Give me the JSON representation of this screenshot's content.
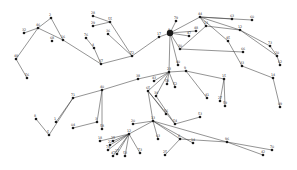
{
  "diagram": {
    "type": "network-graph",
    "width": 297,
    "height": 170,
    "colors": {
      "background": "#ffffff",
      "edge": "#3a3a3a",
      "node": "#1a1a1a",
      "label": "#333333"
    },
    "nodes": [
      {
        "id": "n8hub",
        "label": "8",
        "x": 170,
        "y": 33,
        "r": 3.2
      },
      {
        "id": "n17",
        "label": "17",
        "x": 159,
        "y": 37,
        "r": 1.3
      },
      {
        "id": "n72",
        "label": "72",
        "x": 132,
        "y": 56,
        "r": 1.3
      },
      {
        "id": "n37",
        "label": "37",
        "x": 101,
        "y": 64,
        "r": 1.3
      },
      {
        "id": "n4",
        "label": "4",
        "x": 94,
        "y": 48,
        "r": 1.3
      },
      {
        "id": "n76",
        "label": "76",
        "x": 86,
        "y": 38,
        "r": 1.3
      },
      {
        "id": "n55",
        "label": "55",
        "x": 110,
        "y": 22,
        "r": 1.3
      },
      {
        "id": "n28",
        "label": "28",
        "x": 93,
        "y": 16,
        "r": 1.3
      },
      {
        "id": "n29",
        "label": "29",
        "x": 93,
        "y": 26,
        "r": 1.3
      },
      {
        "id": "n36a",
        "label": "36",
        "x": 108,
        "y": 34,
        "r": 1.3
      },
      {
        "id": "n2",
        "label": "2",
        "x": 51,
        "y": 18,
        "r": 1.3
      },
      {
        "id": "n32",
        "label": "32",
        "x": 24,
        "y": 33,
        "r": 1.3
      },
      {
        "id": "n46",
        "label": "46",
        "x": 38,
        "y": 28,
        "r": 1.3
      },
      {
        "id": "n16",
        "label": "16",
        "x": 63,
        "y": 40,
        "r": 1.3
      },
      {
        "id": "n68",
        "label": "68",
        "x": 52,
        "y": 41,
        "r": 1.3
      },
      {
        "id": "n48a",
        "label": "48",
        "x": 16,
        "y": 59,
        "r": 1.3
      },
      {
        "id": "n56a",
        "label": "56",
        "x": 27,
        "y": 78,
        "r": 1.3
      },
      {
        "id": "n79",
        "label": "79",
        "x": 176,
        "y": 21,
        "r": 1.3
      },
      {
        "id": "n44",
        "label": "44",
        "x": 200,
        "y": 17,
        "r": 1.3
      },
      {
        "id": "n63a",
        "label": "63",
        "x": 232,
        "y": 19,
        "r": 1.3
      },
      {
        "id": "n60",
        "label": "60",
        "x": 252,
        "y": 20,
        "r": 1.3
      },
      {
        "id": "n13a",
        "label": "13",
        "x": 206,
        "y": 26,
        "r": 1.3
      },
      {
        "id": "n48b",
        "label": "48",
        "x": 196,
        "y": 31,
        "r": 1.3
      },
      {
        "id": "n47a",
        "label": "47",
        "x": 189,
        "y": 36,
        "r": 1.3
      },
      {
        "id": "n30",
        "label": "30",
        "x": 180,
        "y": 49,
        "r": 1.3
      },
      {
        "id": "n40a",
        "label": "40",
        "x": 178,
        "y": 65,
        "r": 1.3
      },
      {
        "id": "n45",
        "label": "45",
        "x": 228,
        "y": 41,
        "r": 1.3
      },
      {
        "id": "n12a",
        "label": "12",
        "x": 240,
        "y": 30,
        "r": 1.3
      },
      {
        "id": "n73a",
        "label": "73",
        "x": 270,
        "y": 46,
        "r": 1.3
      },
      {
        "id": "n20a",
        "label": "20",
        "x": 277,
        "y": 56,
        "r": 1.3
      },
      {
        "id": "n62",
        "label": "62",
        "x": 280,
        "y": 65,
        "r": 1.3
      },
      {
        "id": "n66",
        "label": "66",
        "x": 243,
        "y": 52,
        "r": 1.3
      },
      {
        "id": "n33",
        "label": "33",
        "x": 242,
        "y": 66,
        "r": 1.3
      },
      {
        "id": "n14a",
        "label": "14",
        "x": 273,
        "y": 78,
        "r": 1.3
      },
      {
        "id": "n09",
        "label": "09",
        "x": 280,
        "y": 107,
        "r": 1.3
      },
      {
        "id": "n23",
        "label": "23",
        "x": 169,
        "y": 72,
        "r": 1.3
      },
      {
        "id": "n9",
        "label": "9",
        "x": 186,
        "y": 71,
        "r": 1.3
      },
      {
        "id": "n38",
        "label": "38",
        "x": 138,
        "y": 79,
        "r": 1.3
      },
      {
        "id": "n43",
        "label": "43",
        "x": 154,
        "y": 81,
        "r": 1.3
      },
      {
        "id": "n58a",
        "label": "58",
        "x": 167,
        "y": 84,
        "r": 1.3
      },
      {
        "id": "n52",
        "label": "52",
        "x": 175,
        "y": 87,
        "r": 1.3
      },
      {
        "id": "n65",
        "label": "65",
        "x": 148,
        "y": 91,
        "r": 1.3
      },
      {
        "id": "n34",
        "label": "34",
        "x": 156,
        "y": 96,
        "r": 1.3
      },
      {
        "id": "n56b",
        "label": "56",
        "x": 166,
        "y": 114,
        "r": 1.3
      },
      {
        "id": "n54",
        "label": "54",
        "x": 175,
        "y": 124,
        "r": 1.3
      },
      {
        "id": "n53a",
        "label": "53",
        "x": 200,
        "y": 117,
        "r": 1.3
      },
      {
        "id": "n41",
        "label": "41",
        "x": 207,
        "y": 98,
        "r": 1.3
      },
      {
        "id": "n15",
        "label": "15",
        "x": 224,
        "y": 79,
        "r": 1.3
      },
      {
        "id": "n27a",
        "label": "27",
        "x": 220,
        "y": 101,
        "r": 1.3
      },
      {
        "id": "n59",
        "label": "59",
        "x": 225,
        "y": 106,
        "r": 1.3
      },
      {
        "id": "n40b",
        "label": "40",
        "x": 102,
        "y": 90,
        "r": 1.3
      },
      {
        "id": "n71",
        "label": "71",
        "x": 73,
        "y": 98,
        "r": 1.3
      },
      {
        "id": "n1",
        "label": "1",
        "x": 56,
        "y": 122,
        "r": 1.3
      },
      {
        "id": "n5",
        "label": "5",
        "x": 49,
        "y": 135,
        "r": 1.3
      },
      {
        "id": "n8b",
        "label": "8",
        "x": 36,
        "y": 119,
        "r": 1.3
      },
      {
        "id": "n3",
        "label": "3",
        "x": 97,
        "y": 122,
        "r": 1.3
      },
      {
        "id": "n58b",
        "label": "58",
        "x": 102,
        "y": 129,
        "r": 1.3
      },
      {
        "id": "n04",
        "label": "04",
        "x": 73,
        "y": 128,
        "r": 1.3
      },
      {
        "id": "n13b",
        "label": "13",
        "x": 153,
        "y": 121,
        "r": 1.3
      },
      {
        "id": "n20b",
        "label": "20",
        "x": 133,
        "y": 124,
        "r": 1.3
      },
      {
        "id": "n12b",
        "label": "12",
        "x": 129,
        "y": 134,
        "r": 1.3
      },
      {
        "id": "n18",
        "label": "18",
        "x": 100,
        "y": 141,
        "r": 1.3
      },
      {
        "id": "n25a",
        "label": "25",
        "x": 113,
        "y": 141,
        "r": 1.3
      },
      {
        "id": "n22",
        "label": "22",
        "x": 110,
        "y": 145,
        "r": 1.3
      },
      {
        "id": "n74",
        "label": "74",
        "x": 108,
        "y": 150,
        "r": 1.3
      },
      {
        "id": "n27b",
        "label": "27",
        "x": 117,
        "y": 154,
        "r": 1.3
      },
      {
        "id": "n47b",
        "label": "47",
        "x": 113,
        "y": 156,
        "r": 1.3
      },
      {
        "id": "n53b",
        "label": "53",
        "x": 125,
        "y": 156,
        "r": 1.3
      },
      {
        "id": "n73b",
        "label": "73",
        "x": 140,
        "y": 153,
        "r": 1.3
      },
      {
        "id": "n63b",
        "label": "63",
        "x": 158,
        "y": 139,
        "r": 1.3
      },
      {
        "id": "n6",
        "label": "6",
        "x": 180,
        "y": 139,
        "r": 1.3
      },
      {
        "id": "n14b",
        "label": "14",
        "x": 193,
        "y": 143,
        "r": 1.3
      },
      {
        "id": "n25b",
        "label": "25",
        "x": 165,
        "y": 155,
        "r": 1.3
      },
      {
        "id": "n96",
        "label": "96",
        "x": 227,
        "y": 142,
        "r": 1.3
      },
      {
        "id": "n70",
        "label": "70",
        "x": 272,
        "y": 150,
        "r": 1.3
      },
      {
        "id": "n42",
        "label": "42",
        "x": 263,
        "y": 155,
        "r": 1.3
      }
    ],
    "edges": [
      [
        "n8hub",
        "n17"
      ],
      [
        "n17",
        "n72"
      ],
      [
        "n72",
        "n37"
      ],
      [
        "n72",
        "n55"
      ],
      [
        "n72",
        "n36a"
      ],
      [
        "n37",
        "n4"
      ],
      [
        "n4",
        "n76"
      ],
      [
        "n37",
        "n16"
      ],
      [
        "n55",
        "n28"
      ],
      [
        "n55",
        "n29"
      ],
      [
        "n16",
        "n2"
      ],
      [
        "n16",
        "n46"
      ],
      [
        "n2",
        "n46"
      ],
      [
        "n46",
        "n32"
      ],
      [
        "n46",
        "n48a"
      ],
      [
        "n48a",
        "n56a"
      ],
      [
        "n8hub",
        "n79"
      ],
      [
        "n8hub",
        "n44"
      ],
      [
        "n8hub",
        "n48b"
      ],
      [
        "n8hub",
        "n47a"
      ],
      [
        "n8hub",
        "n30"
      ],
      [
        "n8hub",
        "n40a"
      ],
      [
        "n8hub",
        "n23"
      ],
      [
        "n44",
        "n63a"
      ],
      [
        "n44",
        "n60"
      ],
      [
        "n44",
        "n12a"
      ],
      [
        "n44",
        "n45"
      ],
      [
        "n44",
        "n13a"
      ],
      [
        "n13a",
        "n30"
      ],
      [
        "n13a",
        "n12a"
      ],
      [
        "n12a",
        "n73a"
      ],
      [
        "n12a",
        "n20a"
      ],
      [
        "n73a",
        "n20a"
      ],
      [
        "n20a",
        "n62"
      ],
      [
        "n30",
        "n66"
      ],
      [
        "n45",
        "n33"
      ],
      [
        "n33",
        "n14a"
      ],
      [
        "n14a",
        "n09"
      ],
      [
        "n23",
        "n9"
      ],
      [
        "n23",
        "n38"
      ],
      [
        "n23",
        "n43"
      ],
      [
        "n23",
        "n58a"
      ],
      [
        "n23",
        "n52"
      ],
      [
        "n23",
        "n65"
      ],
      [
        "n23",
        "n34"
      ],
      [
        "n9",
        "n41"
      ],
      [
        "n9",
        "n15"
      ],
      [
        "n15",
        "n27a"
      ],
      [
        "n15",
        "n59"
      ],
      [
        "n65",
        "n56b"
      ],
      [
        "n65",
        "n54"
      ],
      [
        "n34",
        "n54"
      ],
      [
        "n54",
        "n53a"
      ],
      [
        "n65",
        "n13b"
      ],
      [
        "n38",
        "n40b"
      ],
      [
        "n40b",
        "n71"
      ],
      [
        "n40b",
        "n3"
      ],
      [
        "n40b",
        "n58b"
      ],
      [
        "n3",
        "n04"
      ],
      [
        "n71",
        "n1"
      ],
      [
        "n71",
        "n5"
      ],
      [
        "n5",
        "n8b"
      ],
      [
        "n13b",
        "n20b"
      ],
      [
        "n13b",
        "n12b"
      ],
      [
        "n13b",
        "n63b"
      ],
      [
        "n13b",
        "n6"
      ],
      [
        "n13b",
        "n14b"
      ],
      [
        "n6",
        "n25b"
      ],
      [
        "n6",
        "n96"
      ],
      [
        "n96",
        "n70"
      ],
      [
        "n96",
        "n42"
      ],
      [
        "n13b",
        "n96"
      ],
      [
        "n12b",
        "n18"
      ],
      [
        "n12b",
        "n25a"
      ],
      [
        "n12b",
        "n22"
      ],
      [
        "n12b",
        "n74"
      ],
      [
        "n12b",
        "n27b"
      ],
      [
        "n12b",
        "n47b"
      ],
      [
        "n12b",
        "n53b"
      ],
      [
        "n12b",
        "n73b"
      ]
    ]
  }
}
